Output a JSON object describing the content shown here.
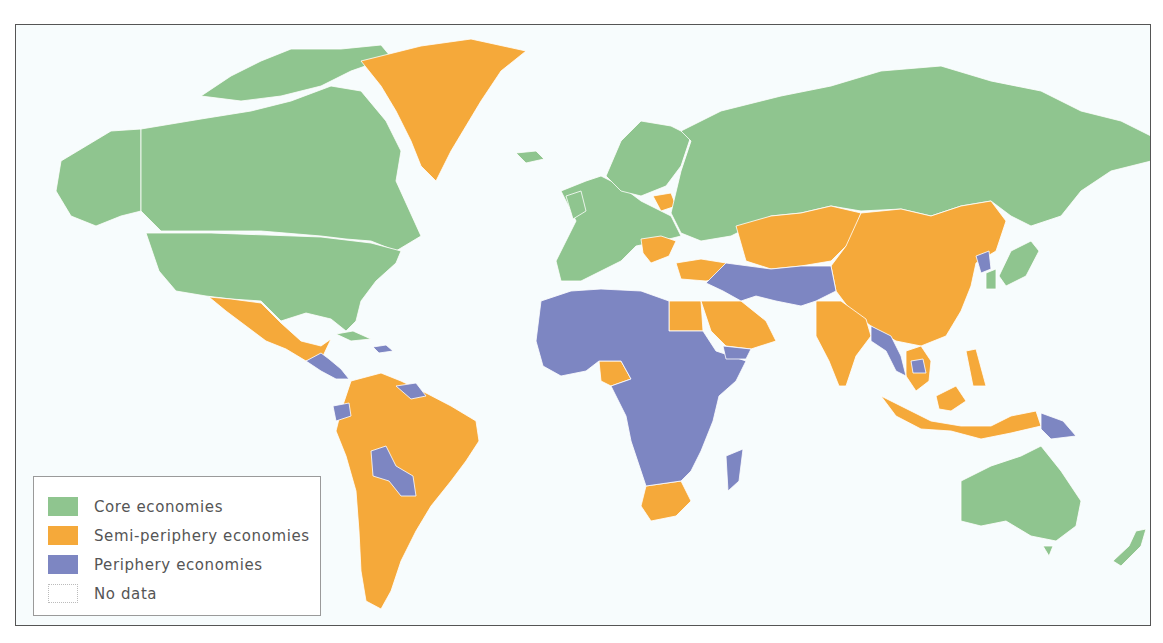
{
  "map": {
    "title": "World-systems classification of economies",
    "background_color": "#f7fcfd",
    "border_color": "#ffffff",
    "colors": {
      "core": "#8fc58f",
      "semi_periphery": "#f5a93a",
      "periphery": "#7d86c2",
      "no_data": "#ffffff"
    },
    "regions": {
      "core": [
        "Canada",
        "United States",
        "Western Europe",
        "Scandinavia",
        "Russia",
        "Japan",
        "South Korea",
        "Australia",
        "New Zealand",
        "Cuba"
      ],
      "semi_periphery": [
        "Greenland",
        "Mexico",
        "Brazil",
        "Argentina",
        "Chile",
        "Peru",
        "Colombia",
        "Venezuela",
        "Uruguay",
        "Poland/Lithuania/Latvia",
        "Romania/Bulgaria/Balkans",
        "Turkey",
        "Kazakhstan",
        "Central Asia",
        "Mongolia",
        "China",
        "India",
        "Sri Lanka",
        "Thailand",
        "Vietnam",
        "Malaysia",
        "Indonesia",
        "Philippines",
        "Egypt",
        "Saudi Arabia",
        "Oman",
        "Nigeria",
        "South Africa"
      ],
      "periphery": [
        "Central America",
        "Caribbean (Haiti/Dominican Rep.)",
        "Guyana/Suriname",
        "Ecuador",
        "Bolivia",
        "Paraguay",
        "North Africa",
        "West Africa",
        "Central Africa",
        "East Africa",
        "Southern Africa (excl. South Africa)",
        "Madagascar",
        "Yemen",
        "Iran",
        "Iraq",
        "Syria",
        "Afghanistan",
        "Pakistan",
        "Nepal",
        "Bangladesh",
        "Myanmar",
        "Cambodia",
        "North Korea",
        "Papua New Guinea"
      ]
    }
  },
  "legend": {
    "items": [
      {
        "label": "Core economies",
        "color": "#8fc58f"
      },
      {
        "label": "Semi-periphery economies",
        "color": "#f5a93a"
      },
      {
        "label": "Periphery economies",
        "color": "#7d86c2"
      },
      {
        "label": "No data",
        "color": "#ffffff"
      }
    ]
  }
}
